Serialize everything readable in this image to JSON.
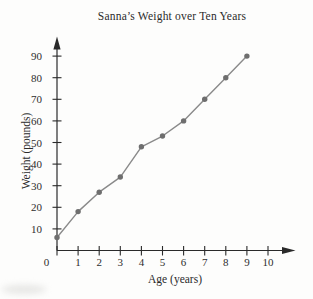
{
  "chart_data": {
    "type": "line",
    "title": "Sanna’s Weight over Ten Years",
    "xlabel": "Age (years)",
    "ylabel": "Weight (pounds)",
    "x": [
      0,
      1,
      2,
      3,
      4,
      5,
      6,
      7,
      8,
      9
    ],
    "y": [
      6,
      18,
      27,
      34,
      48,
      53,
      60,
      70,
      80,
      90
    ],
    "x_ticks": [
      0,
      1,
      2,
      3,
      4,
      5,
      6,
      7,
      8,
      9,
      10
    ],
    "y_ticks": [
      10,
      20,
      30,
      40,
      50,
      60,
      70,
      80,
      90
    ],
    "xlim": [
      0,
      11
    ],
    "ylim": [
      0,
      95
    ],
    "grid": false,
    "legend": false,
    "marker": "circle",
    "line_color": "#8a8a8a",
    "marker_color": "#6e6e6e",
    "axis_color": "#2a2a2a",
    "text_color": "#2e2e2e"
  }
}
